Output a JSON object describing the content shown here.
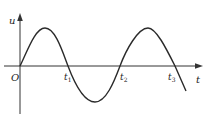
{
  "diagram": {
    "type": "sine-wave-graph",
    "axes": {
      "y_label": "u",
      "x_label": "t",
      "origin_label": "O"
    },
    "markers": [
      {
        "name": "t1",
        "label": "t",
        "subscript": "1"
      },
      {
        "name": "t2",
        "label": "t",
        "subscript": "2"
      },
      {
        "name": "t3",
        "label": "t",
        "subscript": "3"
      }
    ],
    "colors": {
      "curve": "#2a2a2a",
      "axis": "#333333",
      "background": "#ffffff"
    }
  }
}
